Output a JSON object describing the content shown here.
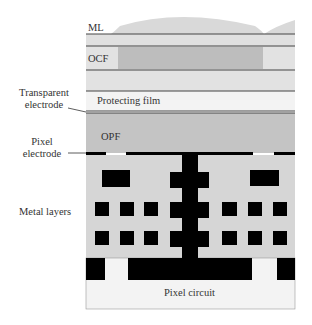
{
  "diagram": {
    "type": "image-sensor-cross-section",
    "layers": {
      "ml": "ML",
      "ocf": "OCF",
      "protecting_film": "Protecting film",
      "opf": "OPF",
      "pixel_circuit": "Pixel circuit"
    },
    "side_labels": {
      "transparent_electrode_line1": "Transparent",
      "transparent_electrode_line2": "electrode",
      "pixel_electrode_line1": "Pixel",
      "pixel_electrode_line2": "electrode",
      "metal_layers": "Metal layers"
    },
    "colors": {
      "ml_fill": "#d9d9d9",
      "layer_light": "#e2e2e2",
      "ocf_dark": "#bdbdbd",
      "protecting_film": "#f2f2f2",
      "opf": "#c4c4c4",
      "metal_bg": "#d6d6d6",
      "metal": "#000000",
      "circuit": "#f3f3f3",
      "line": "#444444"
    }
  }
}
